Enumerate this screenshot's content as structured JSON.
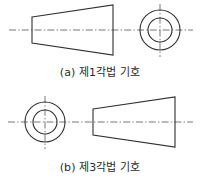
{
  "page": {
    "width": 200,
    "height": 181,
    "background": "#ffffff",
    "line_color": "#303030",
    "centerline_color": "#5e5e5e",
    "caption_color": "#2b2b2b"
  },
  "figures": [
    {
      "id": "first-angle",
      "caption": "(a) 제1각법 기호",
      "side_view_position": "left",
      "end_view_position": "right",
      "frustum": {
        "narrow_end": "left",
        "left_x": 32,
        "right_x": 113,
        "left_half_height": 13,
        "right_half_height": 25,
        "axis_y": 30
      },
      "circles": {
        "center_x": 160,
        "center_y": 30,
        "outer_radius": 20,
        "inner_radius": 12
      },
      "centerlines": {
        "horizontal": {
          "x1": 9,
          "x2": 193,
          "y": 30
        },
        "vertical": {
          "x": 160,
          "y1": 4,
          "y2": 57
        }
      }
    },
    {
      "id": "third-angle",
      "caption": "(b) 제3각법 기호",
      "side_view_position": "right",
      "end_view_position": "left",
      "frustum": {
        "narrow_end": "left",
        "left_x": 93,
        "right_x": 175,
        "left_half_height": 13,
        "right_half_height": 25,
        "axis_y": 32
      },
      "circles": {
        "center_x": 45,
        "center_y": 32,
        "outer_radius": 20,
        "inner_radius": 12
      },
      "centerlines": {
        "horizontal": {
          "x1": 8,
          "x2": 193,
          "y": 32
        },
        "vertical": {
          "x": 45,
          "y1": 6,
          "y2": 59
        }
      }
    }
  ]
}
